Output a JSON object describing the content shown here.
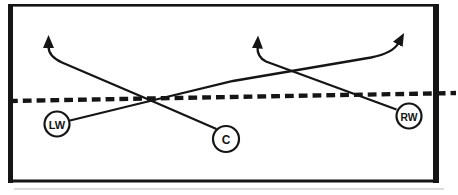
{
  "colors": {
    "ink": "#151515",
    "paper": "#ffffff",
    "scan_shadow": "#c2c2c2"
  },
  "players": [
    {
      "label": "LW"
    },
    {
      "label": "C"
    },
    {
      "label": "RW"
    }
  ],
  "icons": {
    "arrowhead": "filled-triangle-arrowhead",
    "blue_line": "dashed-line"
  }
}
